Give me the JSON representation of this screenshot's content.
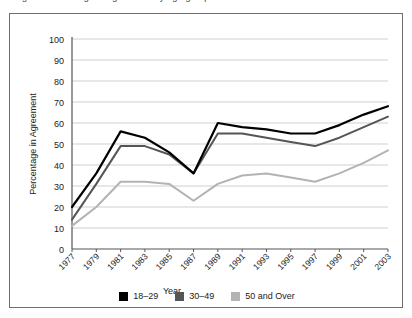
{
  "caption": {
    "clipped_text": "Figure: Percentage in agreement by age group over time"
  },
  "legend": {
    "position": "bottom-center",
    "entries": [
      {
        "label": "18–29",
        "color": "#000000",
        "swatch_name": "legend-swatch-18-29"
      },
      {
        "label": "30–49",
        "color": "#555555",
        "swatch_name": "legend-swatch-30-49"
      },
      {
        "label": "50 and Over",
        "color": "#b3b3b3",
        "swatch_name": "legend-swatch-50-over"
      }
    ]
  },
  "axes": {
    "y_label": "Percentage in Agreement",
    "x_label": "Year",
    "y_ticks": [
      "0",
      "10",
      "20",
      "30",
      "40",
      "50",
      "60",
      "70",
      "80",
      "90",
      "100"
    ],
    "x_ticks": [
      "1977",
      "1979",
      "1981",
      "1983",
      "1985",
      "1987",
      "1989",
      "1991",
      "1993",
      "1995",
      "1997",
      "1999",
      "2001",
      "2003"
    ]
  },
  "colors": {
    "frame": "#6e6e6e",
    "axis": "#555555",
    "grid": "#cfcfcf",
    "text": "#1b1b1b",
    "series_18_29": "#000000",
    "series_30_49": "#555555",
    "series_50_over": "#b3b3b3",
    "background": "#ffffff"
  },
  "chart_data": {
    "type": "line",
    "title": "",
    "xlabel": "Year",
    "ylabel": "Percentage in Agreement",
    "x": [
      1977,
      1979,
      1981,
      1983,
      1985,
      1987,
      1989,
      1991,
      1993,
      1995,
      1997,
      1999,
      2001,
      2003
    ],
    "categories": [
      "1977",
      "1979",
      "1981",
      "1983",
      "1985",
      "1987",
      "1989",
      "1991",
      "1993",
      "1995",
      "1997",
      "1999",
      "2001",
      "2003"
    ],
    "ylim": [
      0,
      100
    ],
    "ytick_step": 10,
    "grid": true,
    "legend_position": "bottom",
    "series": [
      {
        "name": "18–29",
        "color": "#000000",
        "values": [
          20,
          36,
          56,
          53,
          46,
          36,
          60,
          58,
          57,
          55,
          55,
          59,
          64,
          68
        ]
      },
      {
        "name": "30–49",
        "color": "#555555",
        "values": [
          14,
          31,
          49,
          49,
          45,
          36,
          55,
          55,
          53,
          51,
          49,
          53,
          58,
          63
        ]
      },
      {
        "name": "50 and Over",
        "color": "#b3b3b3",
        "values": [
          11,
          20,
          32,
          32,
          31,
          23,
          31,
          35,
          36,
          34,
          32,
          36,
          41,
          47
        ]
      }
    ]
  }
}
